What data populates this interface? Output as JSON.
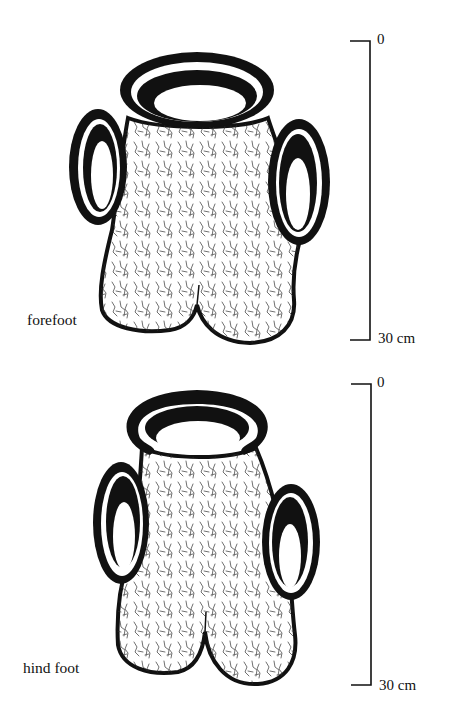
{
  "figure": {
    "panels": [
      {
        "id": "forefoot",
        "label": "forefoot",
        "scale": {
          "top_label": "0",
          "bottom_label": "30 cm"
        }
      },
      {
        "id": "hind-foot",
        "label": "hind foot",
        "scale": {
          "top_label": "0",
          "bottom_label": "30 cm"
        }
      }
    ]
  },
  "colors": {
    "ink": "#111111",
    "paper": "#ffffff",
    "texture": "#2a2a2a"
  }
}
